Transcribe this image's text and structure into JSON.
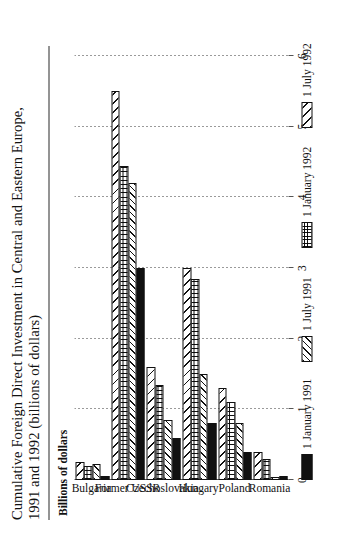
{
  "title": {
    "line1": "Cumulative Foreign Direct Investment in Central and Eastern Europe,",
    "line2": "1991 and 1992 (billions of dollars)"
  },
  "axis_caption": "Billions of dollars",
  "chart_data": {
    "type": "bar",
    "title": "Cumulative Foreign Direct Investment in Central and Eastern Europe, 1991 and 1992 (billions of dollars)",
    "orientation": "vertical-grouped",
    "xlabel": "",
    "ylabel": "Billions of dollars",
    "ylim": [
      0,
      6
    ],
    "yticks": [
      "0",
      "1",
      "2",
      "3",
      "4",
      "5",
      "6"
    ],
    "grid": true,
    "legend_position": "below-axis",
    "categories": [
      "Bulgaria",
      "Former USSR",
      "Czechoslovakia",
      "Hungary",
      "Poland",
      "Romania"
    ],
    "series": [
      {
        "name": "1 January 1991",
        "pattern": "solid-black",
        "values": [
          0.05,
          3.0,
          0.6,
          0.8,
          0.4,
          0.05
        ]
      },
      {
        "name": "1 July 1991",
        "pattern": "diagonal-dense",
        "values": [
          0.22,
          4.2,
          0.85,
          1.5,
          0.8,
          0.03
        ]
      },
      {
        "name": "1 January 1992",
        "pattern": "crosshatch-grid",
        "values": [
          0.2,
          4.45,
          1.35,
          2.85,
          1.1,
          0.3
        ]
      },
      {
        "name": "1 July 1992",
        "pattern": "diagonal-wide",
        "values": [
          0.25,
          5.5,
          1.6,
          3.0,
          1.3,
          0.4
        ]
      }
    ]
  }
}
